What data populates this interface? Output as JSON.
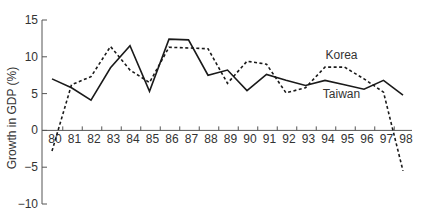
{
  "chart_data": {
    "type": "line",
    "title": "",
    "xlabel": "",
    "ylabel": "Growth in GDP (%)",
    "ylim": [
      -10,
      15
    ],
    "yticks": [
      15,
      10,
      5,
      0,
      -5,
      -10
    ],
    "ytick_labels": [
      "15",
      "10",
      "5",
      "0",
      "−5",
      "−10"
    ],
    "grid": false,
    "legend": "inline labels",
    "x": [
      "80",
      "81",
      "82",
      "83",
      "84",
      "85",
      "86",
      "87",
      "88",
      "89",
      "90",
      "91",
      "92",
      "93",
      "94",
      "95",
      "96",
      "97",
      "98"
    ],
    "series": [
      {
        "name": "Taiwan",
        "style": "solid",
        "color": "#1a1a1a",
        "values": [
          7.0,
          5.8,
          4.1,
          8.5,
          11.5,
          5.3,
          12.4,
          12.3,
          7.5,
          8.2,
          5.4,
          7.6,
          6.8,
          6.1,
          6.8,
          6.2,
          5.6,
          6.8,
          4.8
        ]
      },
      {
        "name": "Korea",
        "style": "dashed",
        "color": "#1a1a1a",
        "values": [
          -2.8,
          6.2,
          7.3,
          11.4,
          8.2,
          6.5,
          11.3,
          11.2,
          11.1,
          6.4,
          9.4,
          9.0,
          5.1,
          5.8,
          8.6,
          8.6,
          7.0,
          5.2,
          -5.5
        ]
      }
    ],
    "annotations": [
      {
        "text": "Korea",
        "x": "95",
        "y": 10.2
      },
      {
        "text": "Taiwan",
        "x": "95",
        "y": 4.9
      }
    ]
  }
}
